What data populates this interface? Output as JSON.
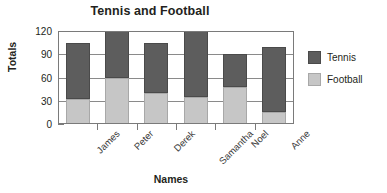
{
  "chart_data": {
    "type": "bar",
    "subtype": "stacked-vertical",
    "title": "Tennis and Football",
    "xlabel": "Names",
    "ylabel": "Totals",
    "categories": [
      "James",
      "Peter",
      "Derek",
      "Samantha",
      "Noel",
      "Anne"
    ],
    "series": [
      {
        "name": "Football",
        "color": "#c6c6c6",
        "values": [
          32,
          60,
          40,
          35,
          48,
          15
        ]
      },
      {
        "name": "Tennis",
        "color": "#5d5d5d",
        "values": [
          72,
          60,
          64,
          85,
          42,
          85
        ]
      }
    ],
    "totals": [
      104,
      120,
      104,
      120,
      90,
      100
    ],
    "ylim": [
      0,
      120
    ],
    "yticks": [
      0,
      30,
      60,
      90,
      120
    ],
    "ytick_labels": [
      "0",
      "30",
      "60",
      "90",
      "120"
    ],
    "grid": true,
    "grid_axis": "y",
    "legend_position": "right",
    "legend_entries": [
      "Tennis",
      "Football"
    ],
    "xtick_label_rotation": -45
  },
  "colors": {
    "tennis": "#5d5d5d",
    "football": "#c6c6c6",
    "axis": "#7a7a7a",
    "grid": "#8a8a8a",
    "text": "#231f20",
    "background": "#ffffff"
  }
}
